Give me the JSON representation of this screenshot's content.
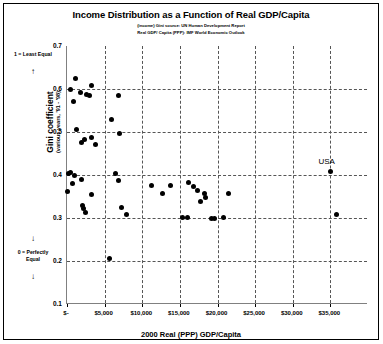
{
  "chart_data": {
    "type": "scatter",
    "title": "Income Distribution as a Function of Real GDP/Capita",
    "subtitle_1": "(income) Gini source:  UN Human Development Report",
    "subtitle_2": "Real GDP/ Capita (PPP):  IMF World Economic Outlook",
    "xlabel": "2000 Real (PPP) GDP/Capita",
    "ylabel": "Gini coefficient",
    "ylabel_sub": "(various years, '91 - '98)",
    "xlim": [
      0,
      40000
    ],
    "ylim": [
      0.1,
      0.7
    ],
    "grid": true,
    "legend": "none",
    "x_ticks": [
      0,
      5000,
      10000,
      15000,
      20000,
      25000,
      30000,
      35000
    ],
    "x_tick_labels": [
      "$-",
      "$5,000",
      "$10,000",
      "$15,000",
      "$20,000",
      "$25,000",
      "$30,000",
      "$35,000"
    ],
    "y_ticks": [
      0.1,
      0.2,
      0.3,
      0.4,
      0.5,
      0.6,
      0.7
    ],
    "y_tick_labels": [
      "0.1",
      "0.2",
      "0.3",
      "0.4",
      "0.5",
      "0.6",
      "0.7"
    ],
    "y_gridlines": [
      0.2,
      0.3,
      0.4,
      0.5,
      0.6
    ],
    "annotations": {
      "y_top_note": "1 = Least Equal",
      "y_top_arrow": "↑",
      "y_bottom_note": "0 = Perfectly Equal",
      "y_bottom_arrow_upper": "↓",
      "y_bottom_arrow_lower": "↓"
    },
    "point_labels": [
      {
        "label": "USA",
        "x": 35000,
        "y": 0.408
      }
    ],
    "points": [
      {
        "x": 1100,
        "y": 0.625
      },
      {
        "x": 500,
        "y": 0.598
      },
      {
        "x": 1800,
        "y": 0.592
      },
      {
        "x": 3300,
        "y": 0.608
      },
      {
        "x": 2600,
        "y": 0.587
      },
      {
        "x": 3000,
        "y": 0.585
      },
      {
        "x": 900,
        "y": 0.57
      },
      {
        "x": 6900,
        "y": 0.585
      },
      {
        "x": 5900,
        "y": 0.53
      },
      {
        "x": 1200,
        "y": 0.505
      },
      {
        "x": 7000,
        "y": 0.497
      },
      {
        "x": 2300,
        "y": 0.482
      },
      {
        "x": 1900,
        "y": 0.475
      },
      {
        "x": 3200,
        "y": 0.487
      },
      {
        "x": 3800,
        "y": 0.47
      },
      {
        "x": 400,
        "y": 0.405
      },
      {
        "x": 200,
        "y": 0.403
      },
      {
        "x": 1000,
        "y": 0.4
      },
      {
        "x": 6400,
        "y": 0.403
      },
      {
        "x": 35000,
        "y": 0.408
      },
      {
        "x": 1900,
        "y": 0.39
      },
      {
        "x": 6800,
        "y": 0.388
      },
      {
        "x": 700,
        "y": 0.38
      },
      {
        "x": 11200,
        "y": 0.375
      },
      {
        "x": 13800,
        "y": 0.375
      },
      {
        "x": 16100,
        "y": 0.382
      },
      {
        "x": 16800,
        "y": 0.373
      },
      {
        "x": 17300,
        "y": 0.365
      },
      {
        "x": 100,
        "y": 0.362
      },
      {
        "x": 12700,
        "y": 0.358
      },
      {
        "x": 18300,
        "y": 0.357
      },
      {
        "x": 3300,
        "y": 0.355
      },
      {
        "x": 18400,
        "y": 0.348
      },
      {
        "x": 21400,
        "y": 0.357
      },
      {
        "x": 17700,
        "y": 0.338
      },
      {
        "x": 2100,
        "y": 0.33
      },
      {
        "x": 2150,
        "y": 0.323
      },
      {
        "x": 2400,
        "y": 0.313
      },
      {
        "x": 7200,
        "y": 0.325
      },
      {
        "x": 7900,
        "y": 0.308
      },
      {
        "x": 15400,
        "y": 0.302
      },
      {
        "x": 16000,
        "y": 0.302
      },
      {
        "x": 19200,
        "y": 0.3
      },
      {
        "x": 19600,
        "y": 0.3
      },
      {
        "x": 20800,
        "y": 0.302
      },
      {
        "x": 35800,
        "y": 0.307
      },
      {
        "x": 5700,
        "y": 0.205
      }
    ]
  }
}
